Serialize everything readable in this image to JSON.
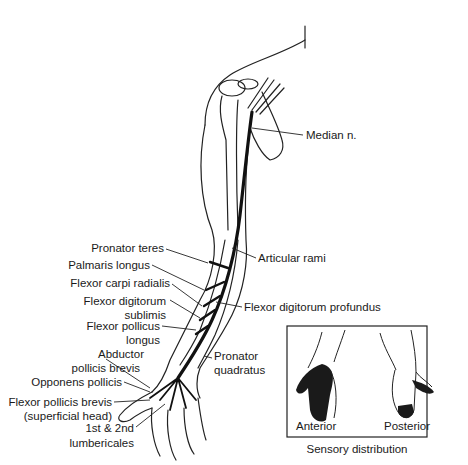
{
  "figure": {
    "labels": {
      "median_n": "Median n.",
      "articular_rami": "Articular rami",
      "pronator_teres": "Pronator teres",
      "palmaris_longus": "Palmaris longus",
      "flexor_carpi_radialis": "Flexor carpi radialis",
      "flexor_digitorum_sublimis_1": "Flexor digitorum",
      "flexor_digitorum_sublimis_2": "sublimis",
      "flexor_digitorum_profundus": "Flexor digitorum profundus",
      "flexor_pollicus_longus_1": "Flexor pollicus",
      "flexor_pollicus_longus_2": "longus",
      "pronator_quadratus_1": "Pronator",
      "pronator_quadratus_2": "quadratus",
      "abductor_pollicis_brevis_1": "Abductor",
      "abductor_pollicis_brevis_2": "pollicis brevis",
      "opponens_pollicis": "Opponens pollicis",
      "flexor_pollicis_brevis_1": "Flexor pollicis brevis",
      "flexor_pollicis_brevis_2": "(superficial head)",
      "lumbricales_1": "1st & 2nd",
      "lumbricales_2": "lumbericales"
    },
    "inset": {
      "anterior": "Anterior",
      "posterior": "Posterior",
      "caption": "Sensory distribution"
    },
    "colors": {
      "ink": "#1a1a1a",
      "nerve": "#111111",
      "shaded": "#1a1a1a",
      "background": "#ffffff"
    }
  }
}
